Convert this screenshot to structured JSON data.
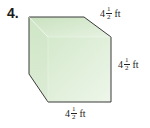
{
  "problem": {
    "number": "4.",
    "figure": "cube",
    "fill_color": "#d7ebcf",
    "edge_color": "#3a3a3a",
    "labels": {
      "top": {
        "whole": "4",
        "numerator": "1",
        "denominator": "2",
        "unit": "ft"
      },
      "right": {
        "whole": "4",
        "numerator": "1",
        "denominator": "2",
        "unit": "ft"
      },
      "bottom": {
        "whole": "4",
        "numerator": "1",
        "denominator": "2",
        "unit": "ft"
      }
    }
  }
}
